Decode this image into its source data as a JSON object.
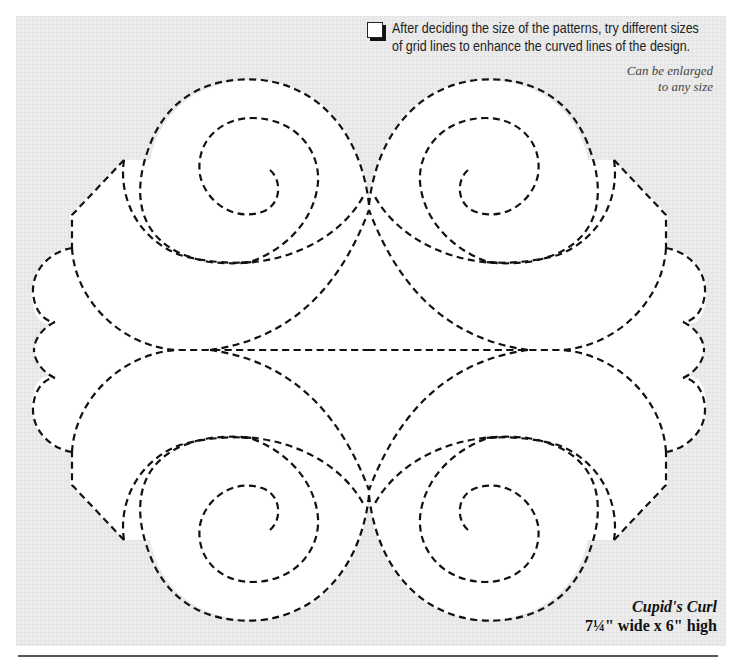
{
  "document": {
    "tip": {
      "icon": "checkbox-icon",
      "line1": "After deciding the size of the patterns, try different sizes",
      "line2": "of grid lines to enhance the curved lines of the design."
    },
    "note": {
      "line1": "Can be enlarged",
      "line2": "to any size"
    },
    "pattern": {
      "name": "Cupid's Curl",
      "dimensions": "7¼\" wide x 6\" high",
      "style": "dashed quilting template",
      "line_color": "#111111",
      "background_color": "#ececec",
      "fill_color": "#ffffff"
    }
  }
}
